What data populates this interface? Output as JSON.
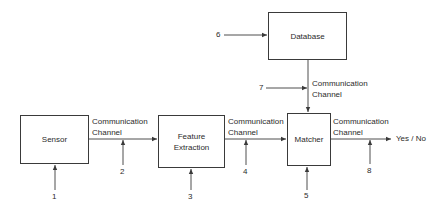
{
  "diagram": {
    "blocks": {
      "sensor": "Sensor",
      "feature_extraction": "Feature\nExtraction",
      "matcher": "Matcher",
      "database": "Database"
    },
    "channels": {
      "sensor_to_feature": "Communication\nChannel",
      "feature_to_matcher": "Communication\nChannel",
      "database_to_matcher": "Communication\nChannel",
      "matcher_to_output": "Communication\nChannel"
    },
    "output": "Yes / No",
    "attack_points": [
      "1",
      "2",
      "3",
      "4",
      "5",
      "6",
      "7",
      "8"
    ],
    "colors": {
      "line": "#3a3a3a",
      "text": "#2b2b2b",
      "background": "#ffffff"
    }
  }
}
